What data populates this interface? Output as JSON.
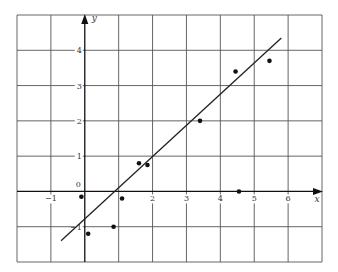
{
  "chart_data": {
    "type": "scatter",
    "title": "",
    "xlabel": "x",
    "ylabel": "y",
    "xlim": [
      -2,
      7
    ],
    "ylim": [
      -2,
      5
    ],
    "grid": true,
    "x_ticks": [
      {
        "value": -1,
        "label": "−1"
      },
      {
        "value": 2,
        "label": "2"
      },
      {
        "value": 3,
        "label": "3"
      },
      {
        "value": 4,
        "label": "4"
      },
      {
        "value": 5,
        "label": "5"
      },
      {
        "value": 6,
        "label": "6"
      }
    ],
    "y_ticks": [
      {
        "value": 4,
        "label": "4"
      },
      {
        "value": 3,
        "label": "3"
      },
      {
        "value": 2,
        "label": "2"
      },
      {
        "value": 1,
        "label": "1"
      },
      {
        "value": -1,
        "label": "−1"
      }
    ],
    "origin_label": "0",
    "series": [
      {
        "name": "data points",
        "type": "scatter",
        "points": [
          {
            "x": -0.1,
            "y": -0.15
          },
          {
            "x": 0.1,
            "y": -1.2
          },
          {
            "x": 0.85,
            "y": -1.0
          },
          {
            "x": 1.1,
            "y": -0.2
          },
          {
            "x": 1.6,
            "y": 0.8
          },
          {
            "x": 1.85,
            "y": 0.75
          },
          {
            "x": 3.4,
            "y": 2.0
          },
          {
            "x": 4.45,
            "y": 3.4
          },
          {
            "x": 4.55,
            "y": 0.0
          },
          {
            "x": 5.45,
            "y": 3.7
          }
        ]
      },
      {
        "name": "line of best fit",
        "type": "line",
        "points": [
          {
            "x": -0.7,
            "y": -1.4
          },
          {
            "x": 5.8,
            "y": 4.35
          }
        ]
      }
    ]
  },
  "colors": {
    "grid": "#555555",
    "axis": "#111111",
    "point": "#111111",
    "line": "#222222",
    "text": "#333333"
  }
}
